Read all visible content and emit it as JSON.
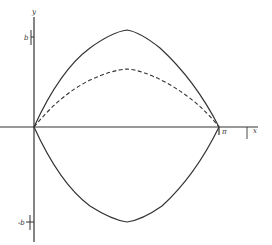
{
  "diagram": {
    "axes": {
      "x_label": "x",
      "y_label": "y",
      "b_label": "b",
      "neg_b_label": "-b",
      "pi_label": "π"
    },
    "curves": [
      {
        "name": "upper-bound",
        "style": "solid",
        "peak": "b"
      },
      {
        "name": "middle-curve",
        "style": "dashed",
        "peak": "b/2 (approx.)"
      },
      {
        "name": "lower-bound",
        "style": "solid",
        "trough": "-b"
      }
    ],
    "colors": {
      "stroke": "#333333",
      "background": "#ffffff"
    }
  }
}
